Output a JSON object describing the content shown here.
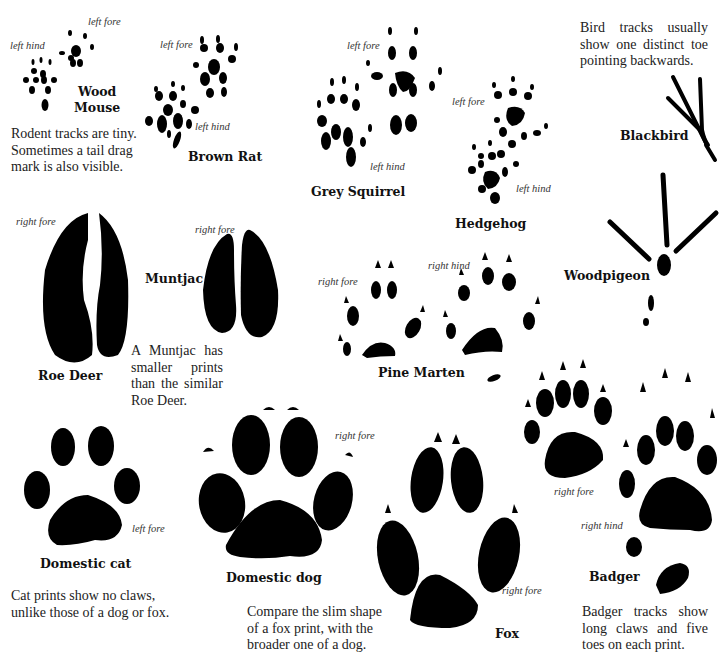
{
  "species": [
    {
      "id": "wood-mouse",
      "name_lines": [
        "Wood",
        "Mouse"
      ],
      "labels": [
        "left fore",
        "left hind"
      ]
    },
    {
      "id": "brown-rat",
      "name": "Brown Rat",
      "labels": [
        "left fore",
        "left hind"
      ]
    },
    {
      "id": "grey-squirrel",
      "name": "Grey Squirrel",
      "labels": [
        "left fore",
        "left hind"
      ]
    },
    {
      "id": "hedgehog",
      "name": "Hedgehog",
      "labels": [
        "left fore",
        "left hind"
      ]
    },
    {
      "id": "blackbird",
      "name": "Blackbird"
    },
    {
      "id": "woodpigeon",
      "name": "Woodpigeon"
    },
    {
      "id": "roe-deer",
      "name": "Roe Deer",
      "labels": [
        "right fore"
      ]
    },
    {
      "id": "muntjac",
      "name": "Muntjac",
      "labels": [
        "right fore"
      ]
    },
    {
      "id": "pine-marten",
      "name": "Pine Marten",
      "labels": [
        "right fore",
        "right hind"
      ]
    },
    {
      "id": "domestic-cat",
      "name": "Domestic cat",
      "labels": [
        "left fore"
      ]
    },
    {
      "id": "domestic-dog",
      "name": "Domestic dog",
      "labels": [
        "right fore"
      ]
    },
    {
      "id": "fox",
      "name": "Fox",
      "labels": [
        "right fore"
      ]
    },
    {
      "id": "badger",
      "name": "Badger",
      "labels": [
        "right fore",
        "right hind"
      ]
    }
  ],
  "captions": {
    "rodent": [
      "Rodent tracks are tiny.",
      "Sometimes a tail drag",
      "mark is also visible."
    ],
    "bird": "Bird tracks usually show one distinct toe pointing backwards.",
    "muntjac": "A Muntjac has smaller prints than the similar Roe Deer.",
    "cat": [
      "Cat prints show no claws,",
      "unlike those of a dog or fox."
    ],
    "fox_dog": [
      "Compare the slim shape",
      "of a fox print, with the",
      "broader one of a dog."
    ],
    "badger": "Badger tracks show long claws and five toes on each print."
  },
  "colors": {
    "ink": "#000000",
    "background": "#ffffff",
    "text": "#222222"
  }
}
